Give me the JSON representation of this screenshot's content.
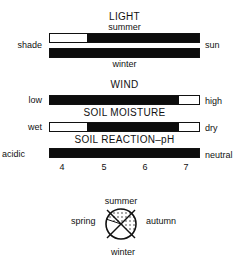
{
  "light": {
    "title": "LIGHT",
    "top_label": "summer",
    "bottom_label": "winter",
    "left_label": "shade",
    "right_label": "sun",
    "summer_bar": [
      {
        "state": "off",
        "from": 0,
        "to": 0.245
      },
      {
        "state": "on",
        "from": 0.245,
        "to": 1
      }
    ],
    "winter_bar": [
      {
        "state": "on",
        "from": 0,
        "to": 1
      }
    ]
  },
  "wind": {
    "title": "WIND",
    "left_label": "low",
    "right_label": "high",
    "bar": [
      {
        "state": "on",
        "from": 0,
        "to": 0.865
      },
      {
        "state": "off",
        "from": 0.865,
        "to": 1
      }
    ]
  },
  "soil_moisture": {
    "title": "SOIL MOISTURE",
    "left_label": "wet",
    "right_label": "dry",
    "bar": [
      {
        "state": "off",
        "from": 0,
        "to": 0.245
      },
      {
        "state": "on",
        "from": 0.245,
        "to": 0.865
      },
      {
        "state": "off",
        "from": 0.865,
        "to": 1
      }
    ]
  },
  "soil_ph": {
    "title": "SOIL REACTION–pH",
    "left_label": "acidic",
    "right_label": "neutral",
    "bar": [
      {
        "state": "on",
        "from": 0,
        "to": 1
      }
    ],
    "ticks": [
      "4",
      "5",
      "6",
      "7"
    ]
  },
  "season_dial": {
    "top": "summer",
    "bottom": "winter",
    "left": "spring",
    "right": "autumn",
    "shaded_segments": [
      "summer",
      "autumn",
      "late spring"
    ]
  }
}
